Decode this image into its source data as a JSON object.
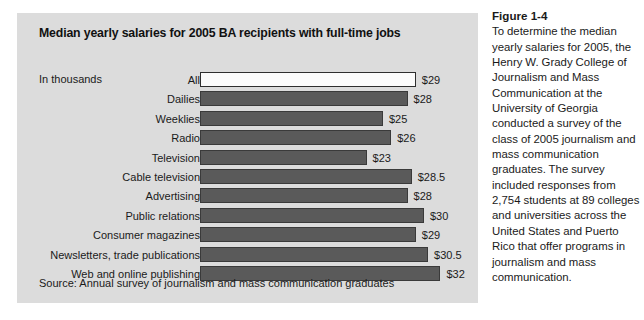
{
  "figure": {
    "heading": "Figure 1-4",
    "body": "To determine the median yearly salaries for 2005, the Henry W. Grady College of Journalism and Mass Communication at the University of Georgia conducted a survey of the class of 2005 journalism and mass communication graduates. The survey included responses from 2,754 students at 89 colleges and universities across the United States and Puerto Rico that offer programs in journalism and mass communication."
  },
  "chart": {
    "title": "Median yearly salaries for 2005 BA recipients with full-time jobs",
    "units_label": "In thousands",
    "source": "Source: Annual survey of journalism and mass communication graduates"
  },
  "chart_data": {
    "type": "bar",
    "orientation": "horizontal",
    "title": "Median yearly salaries for 2005 BA recipients with full-time jobs",
    "xlabel": "",
    "ylabel": "",
    "units": "In thousands",
    "value_prefix": "$",
    "grid": false,
    "legend": null,
    "xlim": [
      0,
      32
    ],
    "categories": [
      "All",
      "Dailies",
      "Weeklies",
      "Radio",
      "Television",
      "Cable television",
      "Advertising",
      "Public relations",
      "Consumer magazines",
      "Newsletters, trade publications",
      "Web and online publishing"
    ],
    "values": [
      29,
      28,
      25,
      26,
      23,
      28.5,
      28,
      30,
      29,
      30.5,
      32
    ],
    "value_labels": [
      "$29",
      "$28",
      "$25",
      "$26",
      "$23",
      "$28.5",
      "$28",
      "$30",
      "$29",
      "$30.5",
      "$32"
    ],
    "bar_colors": [
      "#fbfbfb",
      "#5a5a5a",
      "#5a5a5a",
      "#5a5a5a",
      "#5a5a5a",
      "#5a5a5a",
      "#5a5a5a",
      "#5a5a5a",
      "#5a5a5a",
      "#5a5a5a",
      "#5a5a5a"
    ],
    "bar_outline_color": "#3a3a3a",
    "panel_color": "#dcdcdc",
    "source": "Source: Annual survey of journalism and mass communication graduates"
  }
}
